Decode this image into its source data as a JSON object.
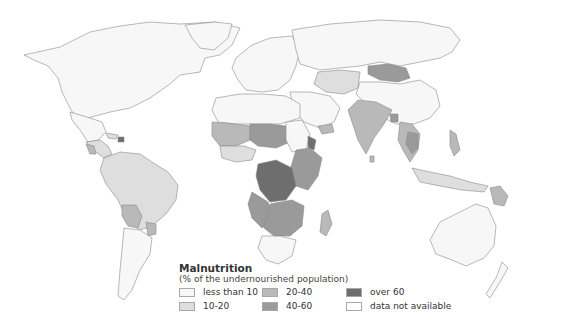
{
  "map": {
    "type": "choropleth",
    "subject": "Malnutrition",
    "projection": "world (Pacific-clipped, Europe/Africa centred)"
  },
  "legend": {
    "title": "Malnutrition",
    "subtitle": "(% of the undernourished population)",
    "items": [
      {
        "label": "less than 10",
        "color": "#f7f7f7"
      },
      {
        "label": "10-20",
        "color": "#dedede"
      },
      {
        "label": "20-40",
        "color": "#b9b9b9"
      },
      {
        "label": "40-60",
        "color": "#9a9a9a"
      },
      {
        "label": "over 60",
        "color": "#6e6e6e"
      },
      {
        "label": "data not available",
        "color": "#ffffff"
      }
    ]
  },
  "regions": [
    {
      "name": "North America",
      "class": "less than 10"
    },
    {
      "name": "Europe",
      "class": "less than 10"
    },
    {
      "name": "Russia",
      "class": "less than 10"
    },
    {
      "name": "Mongolia",
      "class": "20-40"
    },
    {
      "name": "China",
      "class": "less than 10"
    },
    {
      "name": "India",
      "class": "20-40"
    },
    {
      "name": "Mainland Southeast Asia",
      "class": "20-40"
    },
    {
      "name": "Philippines",
      "class": "20-40"
    },
    {
      "name": "Papua New Guinea",
      "class": "20-40"
    },
    {
      "name": "Australia",
      "class": "less than 10"
    },
    {
      "name": "Central America",
      "class": "10-20"
    },
    {
      "name": "Haiti",
      "class": "over 60"
    },
    {
      "name": "South America (north)",
      "class": "10-20"
    },
    {
      "name": "Bolivia",
      "class": "20-40"
    },
    {
      "name": "Argentina / Chile",
      "class": "less than 10"
    },
    {
      "name": "North Africa",
      "class": "less than 10"
    },
    {
      "name": "Sahel / West Africa",
      "class": "20-40"
    },
    {
      "name": "Chad",
      "class": "40-60"
    },
    {
      "name": "Central Africa (DR Congo)",
      "class": "over 60"
    },
    {
      "name": "Eritrea",
      "class": "over 60"
    },
    {
      "name": "East Africa",
      "class": "40-60"
    },
    {
      "name": "Southern Africa",
      "class": "40-60"
    },
    {
      "name": "South Africa",
      "class": "less than 10"
    },
    {
      "name": "Madagascar",
      "class": "20-40"
    }
  ]
}
